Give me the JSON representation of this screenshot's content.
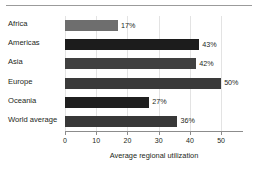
{
  "chart_data": {
    "type": "bar",
    "orientation": "horizontal",
    "title": "",
    "xlabel": "Average regional utilization",
    "ylabel": "",
    "categories": [
      "Africa",
      "Americas",
      "Asia",
      "Europe",
      "Oceania",
      "World average"
    ],
    "values": [
      17,
      43,
      42,
      50,
      27,
      36
    ],
    "value_labels": [
      "17%",
      "43%",
      "42%",
      "50%",
      "27%",
      "36%"
    ],
    "bar_colors": [
      "#6e6e6e",
      "#1c1c1c",
      "#404040",
      "#3a3a3a",
      "#1f1f1f",
      "#383838"
    ],
    "xlim": [
      0,
      57
    ],
    "xticks": [
      0,
      10,
      20,
      30,
      40,
      50
    ],
    "xtick_labels": [
      "0",
      "10",
      "20",
      "30",
      "40",
      "50"
    ],
    "grid": "vertical",
    "gridline_color": "#e3e3e3",
    "legend": "none",
    "axis_color": "#8c8c8c",
    "text_color": "#231f20",
    "background": "#ffffff"
  },
  "decorations": {
    "top_rule_color": "#9b9b9b"
  }
}
